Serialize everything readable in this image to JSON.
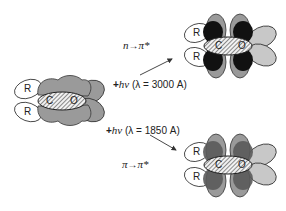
{
  "diagram": {
    "ground_state": {
      "atoms": [
        "C",
        "O"
      ],
      "substituents": [
        "R",
        "R"
      ]
    },
    "transition_n": {
      "label_from": "n",
      "arrow": "→",
      "label_to": "π*",
      "energy_plus": "+",
      "energy_h": "h",
      "energy_nu": "ν",
      "wavelength": "(λ = 3000 A)",
      "atoms": [
        "C",
        "O"
      ],
      "substituents": [
        "R",
        "R"
      ]
    },
    "transition_pi": {
      "label_from": "π",
      "arrow": "→",
      "label_to": "π*",
      "energy_plus": "+",
      "energy_h": "h",
      "energy_nu": "ν",
      "wavelength": "(λ = 1850 A)",
      "atoms": [
        "C",
        "O"
      ],
      "substituents": [
        "R",
        "R"
      ]
    },
    "colors": {
      "lobe_gray": "#9a9a9a",
      "lobe_light": "#c8c8c8",
      "lobe_black": "#111111",
      "lobe_dark": "#5a5a5a",
      "outline": "#333333"
    }
  }
}
